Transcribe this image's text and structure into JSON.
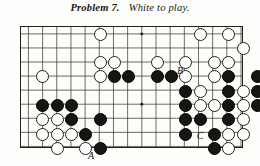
{
  "title": {
    "problem_label": "Problem 7.",
    "instruction": "White to play."
  },
  "board": {
    "name": "go-board",
    "cols": 16,
    "rows": 9,
    "cell": 14.3,
    "origin_x": 7.5,
    "origin_y": 7.0,
    "colors": {
      "black_stone": "#17150f",
      "white_stone": "#fefefc",
      "line": "#3b372f",
      "border": "#23201a",
      "paper": "#fdfdfb"
    },
    "star_points": [
      {
        "c": 8,
        "r": 0
      },
      {
        "c": 14,
        "r": 0
      },
      {
        "c": 8,
        "r": 5
      },
      {
        "c": 14,
        "r": 5
      }
    ]
  },
  "stones": [
    {
      "c": 5,
      "r": 0,
      "color": "white"
    },
    {
      "c": 12,
      "r": 0,
      "color": "white"
    },
    {
      "c": 14,
      "r": 0,
      "color": "white"
    },
    {
      "c": 15,
      "r": 1,
      "color": "white"
    },
    {
      "c": 5,
      "r": 2,
      "color": "white"
    },
    {
      "c": 6,
      "r": 2,
      "color": "white"
    },
    {
      "c": 9,
      "r": 2,
      "color": "white"
    },
    {
      "c": 11,
      "r": 2,
      "color": "white"
    },
    {
      "c": 13,
      "r": 2,
      "color": "white"
    },
    {
      "c": 14,
      "r": 2,
      "color": "white"
    },
    {
      "c": 1,
      "r": 3,
      "color": "white"
    },
    {
      "c": 5,
      "r": 3,
      "color": "white"
    },
    {
      "c": 6,
      "r": 3,
      "color": "black"
    },
    {
      "c": 7,
      "r": 3,
      "color": "black"
    },
    {
      "c": 9,
      "r": 3,
      "color": "black"
    },
    {
      "c": 10,
      "r": 3,
      "color": "black"
    },
    {
      "c": 11,
      "r": 3,
      "color": "white"
    },
    {
      "c": 13,
      "r": 3,
      "color": "white"
    },
    {
      "c": 14,
      "r": 3,
      "color": "black"
    },
    {
      "c": 16,
      "r": 3,
      "color": "black"
    },
    {
      "c": 11,
      "r": 4,
      "color": "black"
    },
    {
      "c": 12,
      "r": 4,
      "color": "white"
    },
    {
      "c": 14,
      "r": 4,
      "color": "black"
    },
    {
      "c": 15,
      "r": 4,
      "color": "white"
    },
    {
      "c": 16,
      "r": 4,
      "color": "black"
    },
    {
      "c": 1,
      "r": 5,
      "color": "black"
    },
    {
      "c": 2,
      "r": 5,
      "color": "black"
    },
    {
      "c": 3,
      "r": 5,
      "color": "black"
    },
    {
      "c": 11,
      "r": 5,
      "color": "black"
    },
    {
      "c": 12,
      "r": 5,
      "color": "white"
    },
    {
      "c": 13,
      "r": 5,
      "color": "white"
    },
    {
      "c": 14,
      "r": 5,
      "color": "black"
    },
    {
      "c": 15,
      "r": 5,
      "color": "white"
    },
    {
      "c": 16,
      "r": 5,
      "color": "black"
    },
    {
      "c": 1,
      "r": 6,
      "color": "white"
    },
    {
      "c": 2,
      "r": 6,
      "color": "white"
    },
    {
      "c": 3,
      "r": 6,
      "color": "black"
    },
    {
      "c": 5,
      "r": 6,
      "color": "black"
    },
    {
      "c": 11,
      "r": 6,
      "color": "black"
    },
    {
      "c": 12,
      "r": 6,
      "color": "black"
    },
    {
      "c": 14,
      "r": 6,
      "color": "black"
    },
    {
      "c": 15,
      "r": 6,
      "color": "white"
    },
    {
      "c": 1,
      "r": 7,
      "color": "white"
    },
    {
      "c": 2,
      "r": 7,
      "color": "white"
    },
    {
      "c": 3,
      "r": 7,
      "color": "white"
    },
    {
      "c": 4,
      "r": 7,
      "color": "black"
    },
    {
      "c": 11,
      "r": 7,
      "color": "black"
    },
    {
      "c": 13,
      "r": 7,
      "color": "black"
    },
    {
      "c": 14,
      "r": 7,
      "color": "white"
    },
    {
      "c": 15,
      "r": 7,
      "color": "white"
    },
    {
      "c": 2,
      "r": 8,
      "color": "white"
    },
    {
      "c": 4,
      "r": 8,
      "color": "white"
    },
    {
      "c": 5,
      "r": 8,
      "color": "black"
    },
    {
      "c": 13,
      "r": 8,
      "color": "black"
    },
    {
      "c": 14,
      "r": 8,
      "color": "white"
    }
  ],
  "labels": [
    {
      "text": "A",
      "x": 91,
      "y": 156,
      "name": "point-label-a"
    },
    {
      "text": "B",
      "x": 180,
      "y": 71,
      "name": "point-label-b"
    },
    {
      "text": "C",
      "x": 200,
      "y": 136,
      "name": "point-label-c"
    }
  ]
}
